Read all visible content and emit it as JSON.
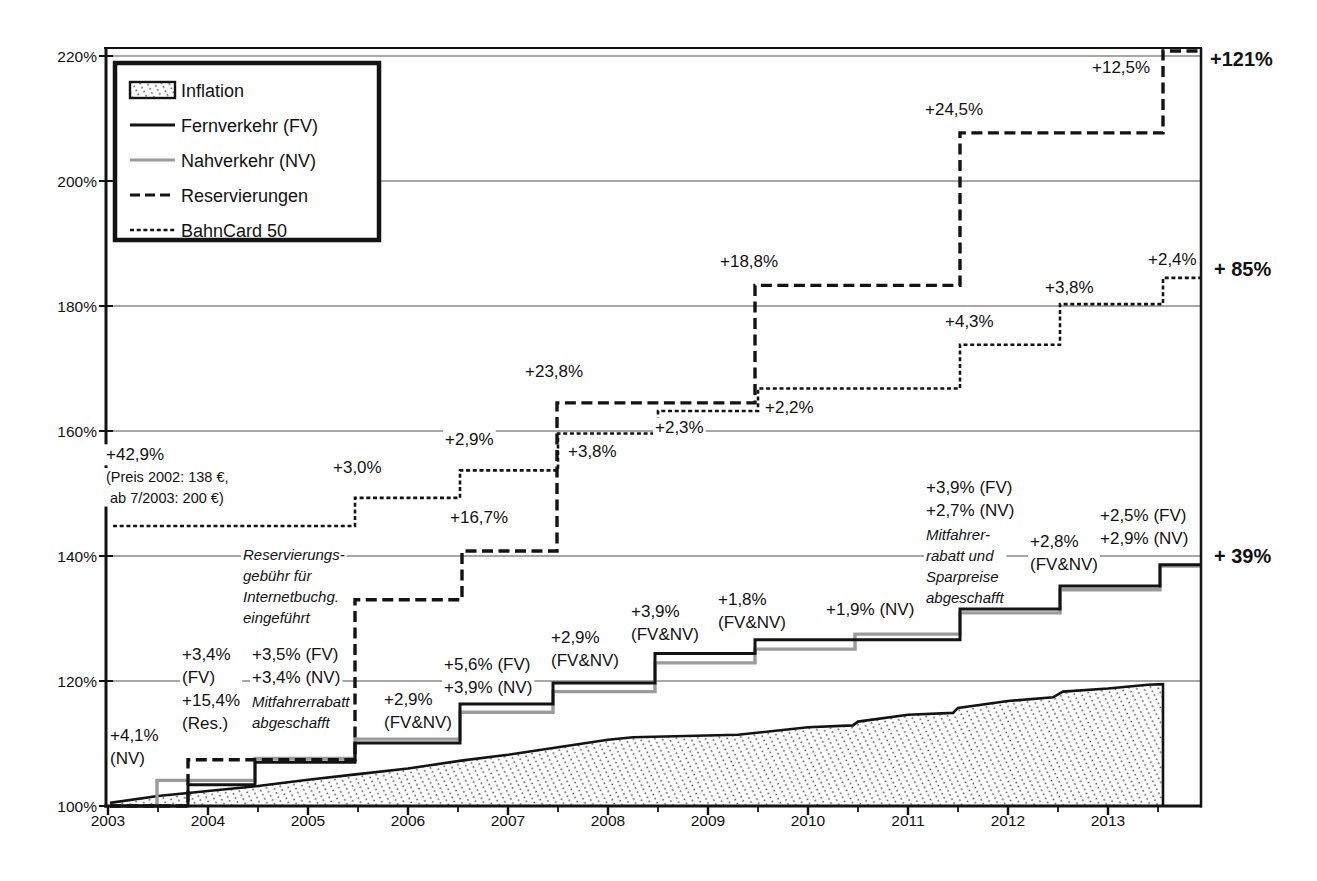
{
  "figure": {
    "background": "#ffffff",
    "line_color": "#131313",
    "nv_color": "#9b9b9b",
    "grid_color": "#8a8a8a"
  },
  "chart_data": {
    "type": "line",
    "title": "",
    "xlabel": "",
    "ylabel": "",
    "x_axis": {
      "years": [
        "2003",
        "2004",
        "2005",
        "2006",
        "2007",
        "2008",
        "2009",
        "2010",
        "2011",
        "2012",
        "2013"
      ],
      "year_values": [
        2003,
        2004,
        2005,
        2006,
        2007,
        2008,
        2009,
        2010,
        2011,
        2012,
        2013
      ],
      "range": [
        2003,
        2013.95
      ],
      "minor_ticks_every": 0.5
    },
    "y_axis": {
      "tick_labels": [
        "100%",
        "120%",
        "140%",
        "160%",
        "180%",
        "200%",
        "220%"
      ],
      "tick_values": [
        100,
        120,
        140,
        160,
        180,
        200,
        220
      ],
      "range": [
        100,
        221
      ]
    },
    "legend": [
      {
        "label": "Inflation",
        "swatch": "hatch",
        "color": "#131313"
      },
      {
        "label": "Fernverkehr (FV)",
        "swatch": "line",
        "color": "#131313"
      },
      {
        "label": "Nahverkehr (NV)",
        "swatch": "line",
        "color": "#9b9b9b"
      },
      {
        "label": "Reservierungen",
        "swatch": "dash",
        "color": "#131313"
      },
      {
        "label": "BahnCard 50",
        "swatch": "fine-dash",
        "color": "#131313"
      }
    ],
    "series": [
      {
        "name": "Inflation",
        "type": "area",
        "color": "#131313",
        "width": 2.6,
        "end_drop": 2013.55,
        "points": [
          [
            2003.02,
            100.5
          ],
          [
            2003.5,
            101.6
          ],
          [
            2004,
            102.4
          ],
          [
            2004.5,
            103.2
          ],
          [
            2005,
            104.2
          ],
          [
            2005.5,
            105.1
          ],
          [
            2006,
            106.0
          ],
          [
            2006.55,
            107.3
          ],
          [
            2007,
            108.2
          ],
          [
            2007.5,
            109.4
          ],
          [
            2008,
            110.6
          ],
          [
            2008.25,
            111.0
          ],
          [
            2009.3,
            111.4
          ],
          [
            2010,
            112.6
          ],
          [
            2010.45,
            112.9
          ],
          [
            2010.5,
            113.5
          ],
          [
            2011,
            114.6
          ],
          [
            2011.45,
            114.9
          ],
          [
            2011.5,
            115.7
          ],
          [
            2012,
            116.8
          ],
          [
            2012.45,
            117.4
          ],
          [
            2012.55,
            118.3
          ],
          [
            2013,
            118.8
          ],
          [
            2013.4,
            119.4
          ],
          [
            2013.55,
            119.5
          ]
        ]
      },
      {
        "name": "Nahverkehr (NV)",
        "type": "step",
        "color": "#9b9b9b",
        "width": 3.4,
        "end_x": 2013.93,
        "points": [
          [
            2003.02,
            100
          ],
          [
            2003.49,
            104.1
          ],
          [
            2004.47,
            107.6
          ],
          [
            2005.47,
            110.7
          ],
          [
            2006.52,
            115.0
          ],
          [
            2007.45,
            118.3
          ],
          [
            2008.47,
            122.9
          ],
          [
            2009.47,
            125.1
          ],
          [
            2010.47,
            127.5
          ],
          [
            2011.52,
            130.9
          ],
          [
            2012.52,
            134.6
          ],
          [
            2013.52,
            138.4
          ]
        ]
      },
      {
        "name": "Fernverkehr (FV)",
        "type": "step",
        "color": "#131313",
        "width": 3.0,
        "end_x": 2013.93,
        "points": [
          [
            2003.02,
            100
          ],
          [
            2003.8,
            103.4
          ],
          [
            2004.47,
            107.0
          ],
          [
            2005.47,
            110.1
          ],
          [
            2006.52,
            116.3
          ],
          [
            2007.45,
            119.7
          ],
          [
            2008.47,
            124.4
          ],
          [
            2009.47,
            126.6
          ],
          [
            2011.52,
            131.5
          ],
          [
            2012.52,
            135.2
          ],
          [
            2013.52,
            138.6
          ]
        ]
      },
      {
        "name": "Reservierungen",
        "type": "step",
        "color": "#131313",
        "width": 3.4,
        "dash": "11,5.5",
        "end_x": 2013.93,
        "points": [
          [
            2003.02,
            100
          ],
          [
            2003.8,
            107.4
          ],
          [
            2005.47,
            133.0
          ],
          [
            2006.54,
            140.8
          ],
          [
            2007.49,
            164.5
          ],
          [
            2009.47,
            183.3
          ],
          [
            2011.52,
            207.7
          ],
          [
            2013.55,
            220.8
          ]
        ]
      },
      {
        "name": "BahnCard 50",
        "type": "step",
        "color": "#131313",
        "width": 2.6,
        "dash": "4,2.7",
        "end_x": 2013.93,
        "points": [
          [
            2003.05,
            144.8
          ],
          [
            2005.47,
            149.3
          ],
          [
            2006.52,
            153.7
          ],
          [
            2007.5,
            159.6
          ],
          [
            2008.5,
            163.2
          ],
          [
            2009.5,
            166.8
          ],
          [
            2011.52,
            173.8
          ],
          [
            2012.52,
            180.3
          ],
          [
            2013.55,
            184.5
          ]
        ]
      }
    ],
    "annotations": [
      {
        "name": "bahncard-start-label",
        "x": 106,
        "y": 445,
        "size": 17,
        "lines": [
          "+42,9%"
        ]
      },
      {
        "name": "bahncard-start-note",
        "x": 106,
        "y": 469,
        "size": 14.5,
        "lines": [
          "(Preis 2002: 138 €,",
          " ab  7/2003: 200 €)"
        ]
      },
      {
        "name": "bahncard-step-2005",
        "x": 333,
        "y": 458,
        "size": 17,
        "lines": [
          "+3,0%"
        ]
      },
      {
        "name": "bahncard-step-2006",
        "x": 445,
        "y": 430,
        "size": 17,
        "lines": [
          "+2,9%"
        ]
      },
      {
        "name": "bahncard-step-2007",
        "x": 568,
        "y": 442,
        "size": 17,
        "lines": [
          "+3,8%"
        ]
      },
      {
        "name": "reservierung-step-2006",
        "x": 450,
        "y": 508,
        "size": 17,
        "lines": [
          "+16,7%"
        ]
      },
      {
        "name": "reservierung-step-2007",
        "x": 525,
        "y": 362,
        "size": 17,
        "lines": [
          "+23,8%"
        ]
      },
      {
        "name": "bahncard-step-2008",
        "x": 655,
        "y": 418,
        "size": 17,
        "lines": [
          "+2,3%"
        ]
      },
      {
        "name": "bahncard-step-2009",
        "x": 765,
        "y": 398,
        "size": 17,
        "lines": [
          "+2,2%"
        ]
      },
      {
        "name": "reservierung-step-2009",
        "x": 720,
        "y": 252,
        "size": 17,
        "lines": [
          "+18,8%"
        ]
      },
      {
        "name": "bahncard-step-2011",
        "x": 945,
        "y": 312,
        "size": 17,
        "lines": [
          "+4,3%"
        ]
      },
      {
        "name": "bahncard-step-2012",
        "x": 1045,
        "y": 278,
        "size": 17,
        "lines": [
          "+3,8%"
        ]
      },
      {
        "name": "bahncard-step-2013",
        "x": 1148,
        "y": 250,
        "size": 17,
        "lines": [
          "+2,4%"
        ]
      },
      {
        "name": "reservierung-step-2011",
        "x": 925,
        "y": 100,
        "size": 17,
        "lines": [
          "+24,5%"
        ]
      },
      {
        "name": "reservierung-step-2013",
        "x": 1092,
        "y": 58,
        "size": 17,
        "lines": [
          "+12,5%"
        ]
      },
      {
        "name": "note-reservierungsgebuehr",
        "x": 243,
        "y": 546,
        "size": 15,
        "italic": true,
        "lines": [
          "Reservierungs-",
          "gebühr für",
          "Internetbuchg.",
          "eingeführt"
        ]
      },
      {
        "name": "nv-step-2003",
        "x": 110,
        "y": 726,
        "size": 17,
        "lines": [
          "+4,1%",
          "(NV)"
        ]
      },
      {
        "name": "fv-res-step-2003",
        "x": 182,
        "y": 645,
        "size": 17,
        "lines": [
          "+3,4%",
          "(FV)",
          "+15,4%",
          "(Res.)"
        ]
      },
      {
        "name": "fv-nv-step-2004",
        "x": 252,
        "y": 645,
        "size": 17,
        "lines": [
          "+3,5% (FV)",
          "+3,4% (NV)"
        ]
      },
      {
        "name": "note-mitfahrerrabatt-2004",
        "x": 252,
        "y": 693,
        "size": 15,
        "italic": true,
        "lines": [
          "Mitfahrerrabatt",
          "abgeschafft"
        ]
      },
      {
        "name": "fv-nv-step-2005",
        "x": 384,
        "y": 690,
        "size": 17,
        "lines": [
          "+2,9%",
          "(FV&NV)"
        ]
      },
      {
        "name": "fv-nv-step-2006",
        "x": 444,
        "y": 655,
        "size": 17,
        "lines": [
          "+5,6% (FV)",
          "+3,9% (NV)"
        ]
      },
      {
        "name": "fv-nv-step-2007",
        "x": 551,
        "y": 628,
        "size": 17,
        "lines": [
          "+2,9%",
          "(FV&NV)"
        ]
      },
      {
        "name": "fv-nv-step-2008",
        "x": 631,
        "y": 602,
        "size": 17,
        "lines": [
          "+3,9%",
          "(FV&NV)"
        ]
      },
      {
        "name": "fv-nv-step-2009",
        "x": 718,
        "y": 590,
        "size": 17,
        "lines": [
          "+1,8%",
          "(FV&NV)"
        ]
      },
      {
        "name": "nv-step-2010",
        "x": 826,
        "y": 600,
        "size": 17,
        "lines": [
          "+1,9% (NV)"
        ]
      },
      {
        "name": "fv-nv-step-2011",
        "x": 926,
        "y": 478,
        "size": 17,
        "lines": [
          "+3,9% (FV)",
          "+2,7% (NV)"
        ]
      },
      {
        "name": "note-mitfahrerrabatt-2011",
        "x": 926,
        "y": 526,
        "size": 15,
        "italic": true,
        "lines": [
          "Mitfahrer-",
          "rabatt und",
          "Sparpreise",
          "abgeschafft"
        ]
      },
      {
        "name": "fv-nv-step-2012",
        "x": 1030,
        "y": 532,
        "size": 17,
        "lines": [
          "+2,8%",
          "(FV&NV)"
        ]
      },
      {
        "name": "fv-nv-step-2013",
        "x": 1100,
        "y": 506,
        "size": 17,
        "lines": [
          "+2,5% (FV)",
          "+2,9% (NV)"
        ]
      },
      {
        "name": "total-reservierungen",
        "x": 1210,
        "y": 48,
        "size": 20,
        "bold": true,
        "lines": [
          "+121%"
        ]
      },
      {
        "name": "total-bahncard",
        "x": 1214,
        "y": 258,
        "size": 20,
        "bold": true,
        "lines": [
          "+ 85%"
        ]
      },
      {
        "name": "total-fv-nv",
        "x": 1214,
        "y": 545,
        "size": 20,
        "bold": true,
        "lines": [
          "+ 39%"
        ]
      }
    ],
    "totals": [
      {
        "series": "Reservierungen",
        "label": "+121%"
      },
      {
        "series": "BahnCard 50",
        "label": "+ 85%"
      },
      {
        "series": "Fernverkehr/Nahverkehr",
        "label": "+ 39%"
      }
    ]
  }
}
